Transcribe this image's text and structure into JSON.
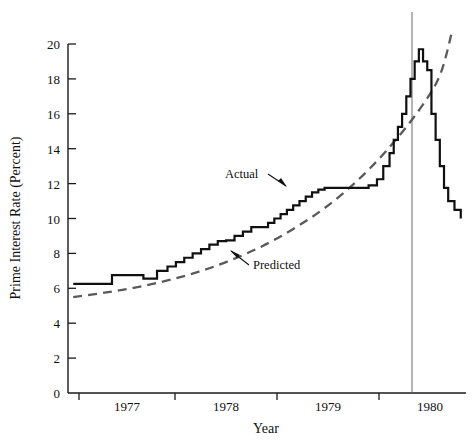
{
  "chart_data": {
    "type": "line",
    "title": "",
    "xlabel": "Year",
    "ylabel": "Prime Interest Rate (Percent)",
    "xlim": [
      1976.55,
      1980.35
    ],
    "ylim": [
      0,
      20
    ],
    "yticks": [
      0,
      2,
      4,
      6,
      8,
      10,
      12,
      14,
      16,
      18,
      20
    ],
    "ytick_labels": [
      "0",
      "2",
      "4",
      "6",
      "8",
      "10",
      "12",
      "14",
      "16",
      "18",
      "20"
    ],
    "xticks": [
      1977,
      1978,
      1979,
      1980
    ],
    "xtick_labels": [
      "1977",
      "1978",
      "1979",
      "1980"
    ],
    "grid": false,
    "legend_position": "inline-annotations",
    "annotations": [
      {
        "name": "actual-label",
        "text": "Actual",
        "x": 1978.05,
        "y": 13.6
      },
      {
        "name": "predicted-label",
        "text": "Predicted",
        "x": 1978.35,
        "y": 8.1
      }
    ],
    "reference_line": {
      "name": "peak-marker",
      "x": 1979.85,
      "y_from": 0,
      "y_to": 20.6
    },
    "series": [
      {
        "name": "Actual",
        "style": "solid-step",
        "color": "#101010",
        "x": [
          1976.6,
          1976.92,
          1976.97,
          1977.2,
          1977.27,
          1977.4,
          1977.5,
          1977.58,
          1977.66,
          1977.74,
          1977.82,
          1977.9,
          1977.98,
          1978.06,
          1978.14,
          1978.22,
          1978.3,
          1978.38,
          1978.46,
          1978.52,
          1978.58,
          1978.64,
          1978.7,
          1978.76,
          1978.82,
          1978.88,
          1978.94,
          1979.0,
          1979.3,
          1979.42,
          1979.5,
          1979.56,
          1979.62,
          1979.66,
          1979.7,
          1979.74,
          1979.78,
          1979.82,
          1979.86,
          1979.9,
          1979.94,
          1979.98,
          1980.02,
          1980.06,
          1980.1,
          1980.14,
          1980.18,
          1980.24,
          1980.3
        ],
        "y": [
          6.25,
          6.25,
          6.75,
          6.75,
          6.55,
          7.0,
          7.25,
          7.5,
          7.75,
          8.0,
          8.25,
          8.5,
          8.7,
          8.75,
          9.0,
          9.25,
          9.5,
          9.5,
          9.75,
          10.0,
          10.25,
          10.5,
          10.75,
          11.0,
          11.25,
          11.5,
          11.65,
          11.75,
          11.75,
          11.9,
          12.25,
          13.0,
          13.75,
          14.5,
          15.25,
          16.0,
          17.0,
          18.0,
          19.0,
          19.7,
          19.0,
          18.5,
          16.0,
          14.5,
          13.0,
          11.75,
          11.0,
          10.5,
          10.0
        ]
      },
      {
        "name": "Predicted",
        "style": "dashed-smooth",
        "color": "#5a5a5a",
        "x": [
          1976.6,
          1976.9,
          1977.2,
          1977.5,
          1977.8,
          1978.1,
          1978.4,
          1978.7,
          1979.0,
          1979.3,
          1979.6,
          1979.9,
          1980.1,
          1980.22
        ],
        "y": [
          5.5,
          5.75,
          6.05,
          6.45,
          6.95,
          7.6,
          8.4,
          9.4,
          10.6,
          12.1,
          13.95,
          16.2,
          18.2,
          20.8
        ]
      }
    ]
  },
  "axes": {
    "y_axis_label": "Prime Interest Rate (Percent)",
    "x_axis_label": "Year"
  }
}
